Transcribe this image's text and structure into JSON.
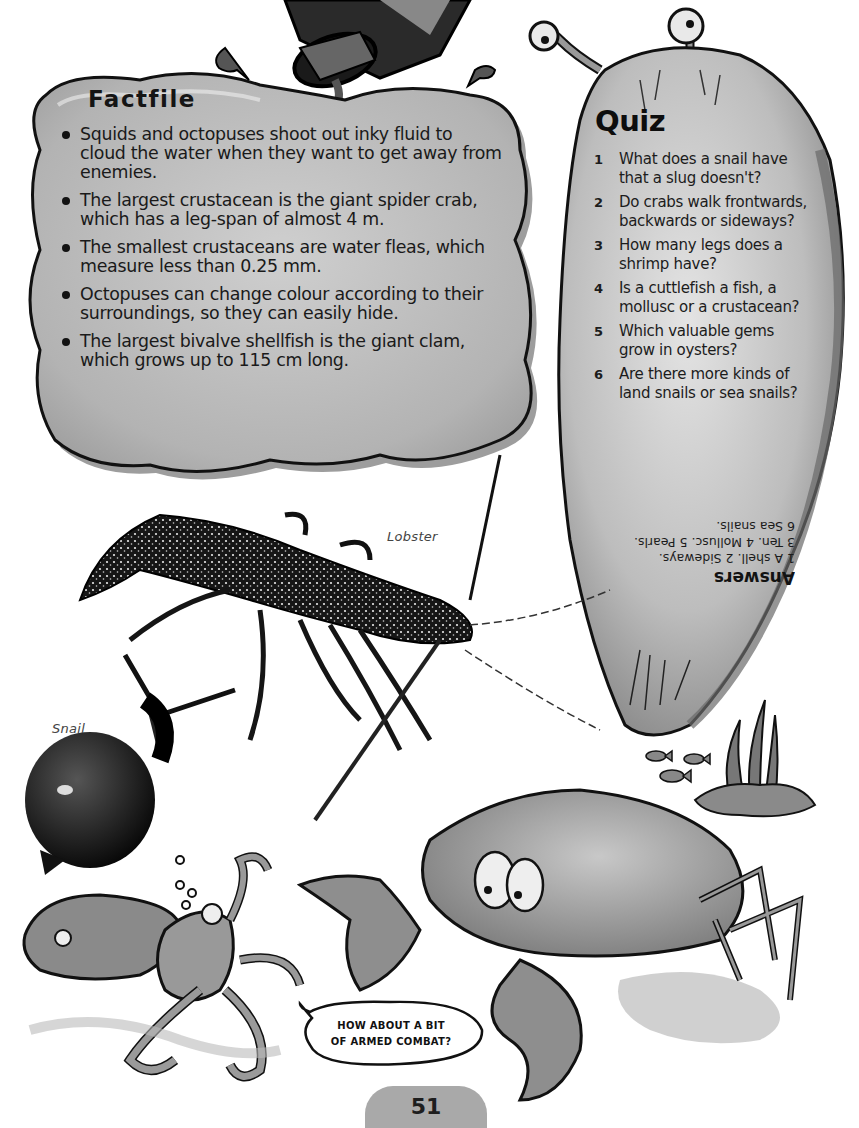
{
  "page": {
    "number": "51",
    "theme_colors": {
      "paper": "#ffffff",
      "panel_fill": "#b9b9b9",
      "panel_shadow": "#8f8f8f",
      "ink": "#141414",
      "badge": "#a9a9a9"
    }
  },
  "factfile": {
    "title": "Factfile",
    "items": [
      {
        "text": "Squids and octopuses shoot out inky fluid to cloud the water when they want to get away from enemies."
      },
      {
        "text": "The largest crustacean is the giant spider crab, which has a leg-span of almost 4 m."
      },
      {
        "text": "The smallest crustaceans are water fleas, which measure less than 0.25 mm."
      },
      {
        "text": "Octopuses can change colour according to their surroundings, so they can easily hide."
      },
      {
        "text": "The largest bivalve shellfish is the giant clam, which grows up to 115 cm long."
      }
    ]
  },
  "quiz": {
    "title": "Quiz",
    "questions": [
      {
        "num": "1",
        "text": "What does a snail have that a slug doesn't?"
      },
      {
        "num": "2",
        "text": "Do crabs walk frontwards, backwards or sideways?"
      },
      {
        "num": "3",
        "text": "How many legs does a shrimp have?"
      },
      {
        "num": "4",
        "text": "Is a cuttlefish a fish, a mollusc or a crustacean?"
      },
      {
        "num": "5",
        "text": "Which valuable gems grow in oysters?"
      },
      {
        "num": "6",
        "text": "Are there more kinds of land snails or sea snails?"
      }
    ],
    "answers": {
      "title": "Answers",
      "lines": [
        "1 A shell. 2 Sideways.",
        "3 Ten. 4 Mollusc. 5 Pearls.",
        "6 Sea snails."
      ],
      "orientation": "upside-down"
    }
  },
  "captions": {
    "lobster": "Lobster",
    "snail": "Snail"
  },
  "speech_bubble": {
    "line1": "HOW ABOUT A BIT",
    "line2": "OF ARMED COMBAT?"
  },
  "illustrations": [
    {
      "name": "ink-bottle",
      "description": "tipped ink bottle pouring ink with drips"
    },
    {
      "name": "slug",
      "description": "cartoon slug with eye stalks forming the quiz panel"
    },
    {
      "name": "lobster",
      "description": "spotted spiny lobster photo"
    },
    {
      "name": "snail",
      "description": "dark shelled snail photo"
    },
    {
      "name": "octopus",
      "description": "cartoon octopus with bubbles"
    },
    {
      "name": "crab",
      "description": "cartoon crab with raised claws"
    },
    {
      "name": "fish",
      "description": "three small cartoon fish"
    },
    {
      "name": "seaweed",
      "description": "seaweed on rock"
    }
  ]
}
